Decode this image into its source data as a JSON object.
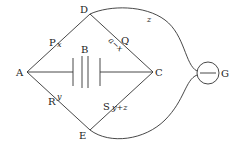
{
  "diagram": {
    "type": "wheatstone-bridge",
    "nodes": {
      "A": {
        "label": "A"
      },
      "B": {
        "label": "B"
      },
      "C": {
        "label": "C"
      },
      "D": {
        "label": "D"
      },
      "E": {
        "label": "E"
      },
      "G": {
        "label": "G"
      }
    },
    "resistors": {
      "P": {
        "label": "P",
        "value": "x"
      },
      "Q": {
        "label": "Q",
        "value": "a−x"
      },
      "R": {
        "label": "R",
        "value": "y"
      },
      "S": {
        "label": "S",
        "value": "y+z"
      }
    },
    "galvanometer_wire": {
      "label": "z"
    }
  }
}
